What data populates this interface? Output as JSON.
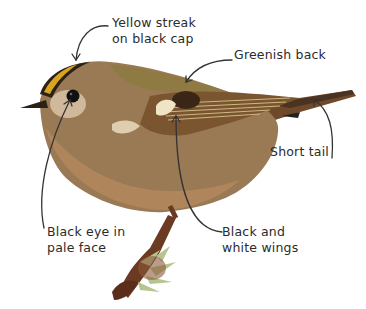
{
  "diagram": {
    "colors": {
      "background": "#ffffff",
      "text": "#2b2b2b",
      "arrow": "#333333",
      "body_brown": "#9a7a55",
      "breast": "#b48a5e",
      "back_green": "#8c7a3e",
      "crest_yellow": "#d9a521",
      "cap_black": "#2a2218",
      "wing_dark": "#4a3322",
      "wing_pale": "#efe4c4",
      "face_pale": "#d9c4a8",
      "twig": "#6b3a22",
      "moss": "#b6c48e"
    },
    "labels": [
      {
        "id": "crest",
        "lines": [
          "Yellow streak",
          "on black cap"
        ]
      },
      {
        "id": "back",
        "lines": [
          "Greenish back"
        ]
      },
      {
        "id": "tail",
        "lines": [
          "Short tail"
        ]
      },
      {
        "id": "eye",
        "lines": [
          "Black eye in",
          "pale face"
        ]
      },
      {
        "id": "wings",
        "lines": [
          "Black and",
          "white wings"
        ]
      }
    ]
  }
}
